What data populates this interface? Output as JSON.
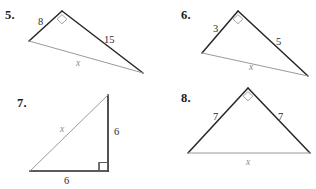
{
  "page": {
    "width": 316,
    "height": 189,
    "background": "#ffffff",
    "ink_dark": "#262626",
    "ink_light": "#9a9a9a"
  },
  "problems": [
    {
      "id": "problem-5",
      "number": "5.",
      "number_pos": {
        "x": 5,
        "y": 9
      },
      "type": "obtuse-triangle-right-angle-at-apex",
      "vertices": {
        "apex": {
          "x": 62,
          "y": 11
        },
        "left": {
          "x": 29,
          "y": 41
        },
        "right": {
          "x": 143,
          "y": 73
        }
      },
      "right_angle_at": "apex",
      "labels": [
        {
          "name": "side-label-8",
          "text": "8",
          "x": 38,
          "y": 17,
          "style": "dark"
        },
        {
          "name": "side-label-15",
          "text": "15",
          "x": 104,
          "y": 35,
          "style": "dark"
        },
        {
          "name": "hypotenuse-label-x",
          "text": "x",
          "x": 76,
          "y": 59,
          "style": "light"
        }
      ]
    },
    {
      "id": "problem-6",
      "number": "6.",
      "number_pos": {
        "x": 181,
        "y": 9
      },
      "type": "obtuse-triangle-right-angle-at-apex",
      "vertices": {
        "apex": {
          "x": 238,
          "y": 11
        },
        "left": {
          "x": 202,
          "y": 53
        },
        "right": {
          "x": 308,
          "y": 76
        }
      },
      "right_angle_at": "apex",
      "labels": [
        {
          "name": "side-label-3",
          "text": "3",
          "x": 213,
          "y": 24,
          "style": "dark"
        },
        {
          "name": "side-label-5",
          "text": "5",
          "x": 276,
          "y": 37,
          "style": "dark"
        },
        {
          "name": "hypotenuse-label-x",
          "text": "x",
          "x": 249,
          "y": 63,
          "style": "light"
        }
      ]
    },
    {
      "id": "problem-7",
      "number": "7.",
      "number_pos": {
        "x": 17,
        "y": 97
      },
      "type": "right-triangle-right-angle-bottom-right",
      "vertices": {
        "top": {
          "x": 108,
          "y": 95
        },
        "bottom_right": {
          "x": 108,
          "y": 171
        },
        "bottom_left": {
          "x": 30,
          "y": 171
        }
      },
      "right_angle_at": "bottom_right",
      "labels": [
        {
          "name": "hypotenuse-label-x",
          "text": "x",
          "x": 60,
          "y": 125,
          "style": "light"
        },
        {
          "name": "side-label-6-vertical",
          "text": "6",
          "x": 114,
          "y": 127,
          "style": "dark"
        },
        {
          "name": "side-label-6-horizontal",
          "text": "6",
          "x": 64,
          "y": 176,
          "style": "dark"
        }
      ]
    },
    {
      "id": "problem-8",
      "number": "8.",
      "number_pos": {
        "x": 181,
        "y": 92
      },
      "type": "isosceles-triangle-right-angle-at-apex",
      "vertices": {
        "apex": {
          "x": 248,
          "y": 88
        },
        "left": {
          "x": 188,
          "y": 153
        },
        "right": {
          "x": 310,
          "y": 153
        }
      },
      "right_angle_at": "apex",
      "labels": [
        {
          "name": "side-label-7-left",
          "text": "7",
          "x": 213,
          "y": 112,
          "style": "dark"
        },
        {
          "name": "side-label-7-right",
          "text": "7",
          "x": 278,
          "y": 112,
          "style": "dark"
        },
        {
          "name": "base-label-x",
          "text": "x",
          "x": 246,
          "y": 158,
          "style": "light"
        }
      ]
    }
  ]
}
